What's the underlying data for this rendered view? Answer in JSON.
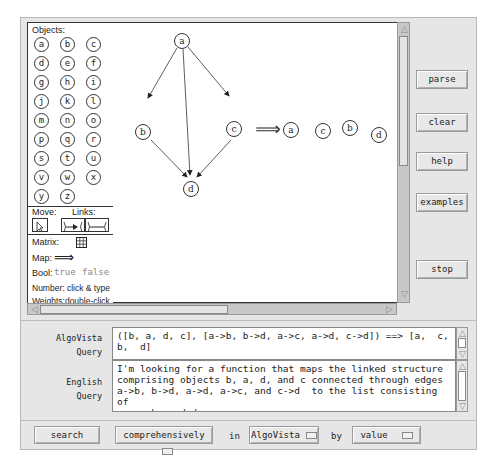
{
  "palette": {
    "objects_label": "Objects:",
    "objects": [
      "a",
      "b",
      "c",
      "d",
      "e",
      "f",
      "g",
      "h",
      "i",
      "j",
      "k",
      "l",
      "m",
      "n",
      "o",
      "p",
      "q",
      "r",
      "s",
      "t",
      "u",
      "v",
      "w",
      "x",
      "y",
      "z"
    ],
    "move_label": "Move:",
    "links_label": "Links:",
    "matrix_label": "Matrix:",
    "map_label": "Map:",
    "map_glyph": "⟹",
    "bool_label": "Bool:",
    "bool_true": "true",
    "bool_false": "false",
    "number_label": "Number: click & type",
    "weights_label": "Weights:double-click"
  },
  "canvas": {
    "graph_nodes": [
      "a",
      "b",
      "c",
      "d"
    ],
    "edges": [
      "a->b",
      "a->d",
      "a->c",
      "b->d",
      "c->d"
    ],
    "map_arrow": "⟹",
    "result_nodes": [
      "a",
      "c",
      "b",
      "d"
    ]
  },
  "side_buttons": {
    "parse": "parse",
    "clear": "clear",
    "help": "help",
    "examples": "examples",
    "stop": "stop"
  },
  "algovista_query": {
    "label_line1": "AlgoVista",
    "label_line2": "Query",
    "value": "([b, a, d, c], [a->b, b->d, a->c, a->d, c->d]) ==> [a,  c,  b,  d]"
  },
  "english_query": {
    "label_line1": "English",
    "label_line2": "Query",
    "value": "I'm looking for a function that maps the linked structure\ncomprising objects b, a, d, and c connected through edges\na->b, b->d, a->d, a->c, and c->d  to the list consisting of\na, c, b, and d."
  },
  "bottom_bar": {
    "search": "search",
    "mode": "comprehensively",
    "in_label": "in",
    "source": "AlgoVista",
    "by_label": "by",
    "order": "value"
  },
  "colors": {
    "frame_bg": "#e6e6e6",
    "canvas_bg": "#ffffff",
    "scrollbar": "#c8c8c8",
    "bool_text": "#888888"
  }
}
